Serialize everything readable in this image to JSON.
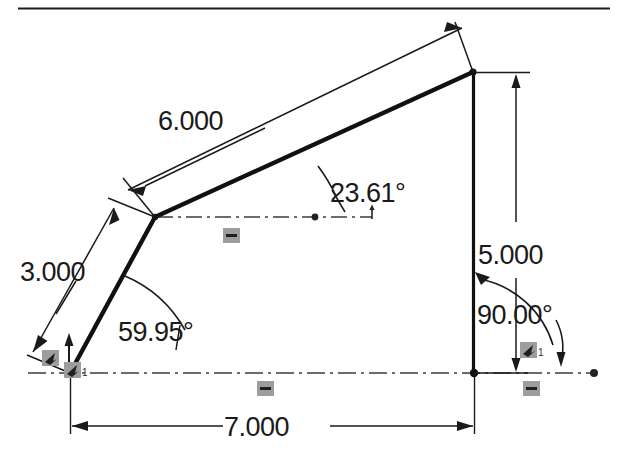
{
  "drawing": {
    "title": "CAD sketch with dimensions",
    "background_color": "#ffffff",
    "geometry_color": "#111111",
    "dimension_color": "#1a1a1a",
    "centerline_color": "#3c3c3c",
    "constraint_badge_color": "#9a9a9a",
    "top_rule_color": "#1b1b1b"
  },
  "dimensions": {
    "upper_edge_length": "6.000",
    "lower_edge_length": "3.000",
    "vertical_height": "5.000",
    "base_width": "7.000",
    "upper_edge_angle": "23.61°",
    "lower_edge_angle": "59.95°",
    "corner_angle": "90.00°"
  },
  "constraints": [
    {
      "name": "fixed-origin-left",
      "type": "fix-icon",
      "label": "",
      "x": 48,
      "y": 356
    },
    {
      "name": "fixed-origin-right",
      "type": "fix-icon",
      "label": "1",
      "x": 70,
      "y": 370
    },
    {
      "name": "horizontal-centerline-mid",
      "type": "horizontal-icon",
      "label": "",
      "x": 231,
      "y": 235
    },
    {
      "name": "horizontal-base-left",
      "type": "horizontal-icon",
      "label": "",
      "x": 265,
      "y": 388
    },
    {
      "name": "fixed-base-right",
      "type": "fix-icon",
      "label": "1",
      "x": 528,
      "y": 350
    },
    {
      "name": "horizontal-base-right",
      "type": "horizontal-icon",
      "label": "",
      "x": 531,
      "y": 388
    }
  ],
  "vertices": {
    "origin": {
      "x": 70,
      "y": 373
    },
    "mid": {
      "x": 155,
      "y": 217
    },
    "apex": {
      "x": 473,
      "y": 72
    },
    "base_right": {
      "x": 474,
      "y": 373
    }
  },
  "labels": {
    "six": "6.000",
    "three": "3.000",
    "five": "5.000",
    "seven": "7.000",
    "angle_upper": "23.61°",
    "angle_lower": "59.95°",
    "angle_corner": "90.00°",
    "badge_one_a": "1",
    "badge_one_b": "1"
  }
}
